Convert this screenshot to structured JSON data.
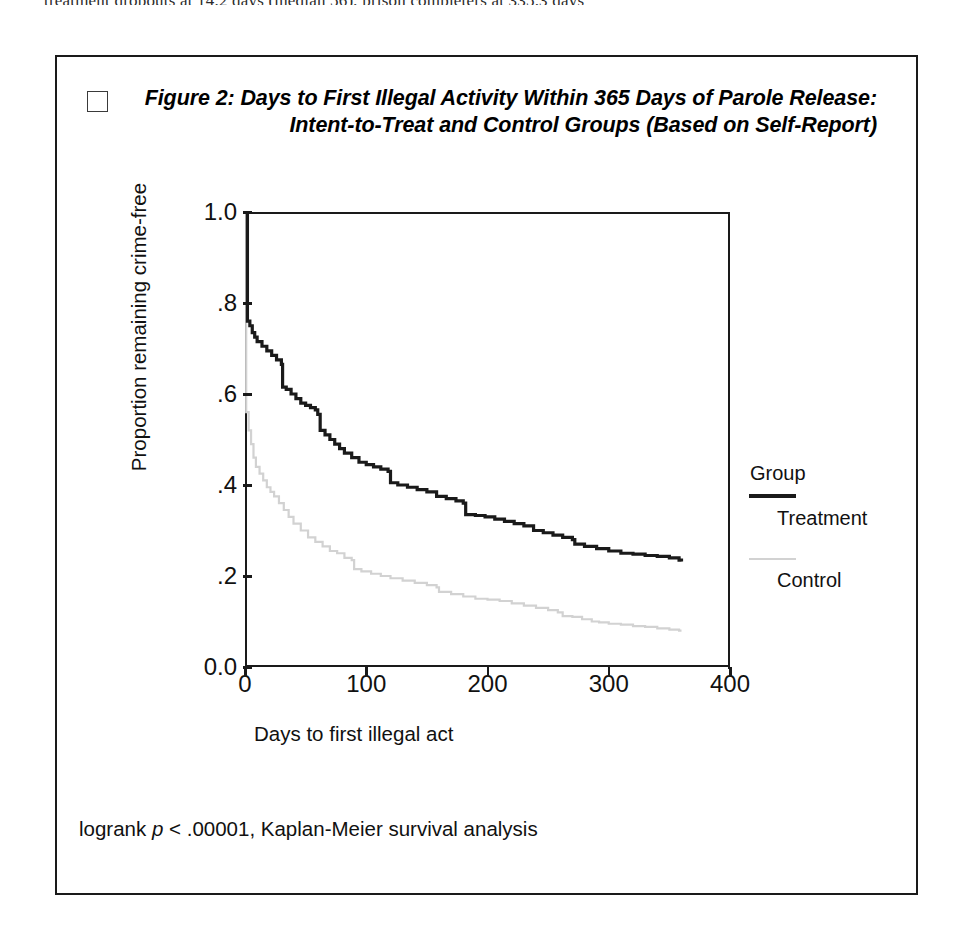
{
  "page": {
    "top_cut_text": "treatment dropouts at 14.2 days (median 56), prison completers at 335.3 days"
  },
  "figure": {
    "marker_icon": "empty-square-marker",
    "title": "Figure 2: Days to First Illegal Activity Within 365 Days of Parole Release: Intent-to-Treat and Control Groups (Based on Self-Report)",
    "footnote_prefix": "logrank ",
    "footnote_italic": "p",
    "footnote_rest": " < .00001, Kaplan-Meier survival analysis",
    "legend": {
      "title": "Group",
      "entries": [
        {
          "label": "Treatment",
          "color": "#1a1a1a"
        },
        {
          "label": "Control",
          "color": "#d2d2d2"
        }
      ]
    }
  },
  "chart_data": {
    "type": "line",
    "subtype": "kaplan-meier-survival",
    "title": "Figure 2: Days to First Illegal Activity Within 365 Days of Parole Release: Intent-to-Treat and Control Groups (Based on Self-Report)",
    "xlabel": "Days to first illegal act",
    "ylabel": "Proportion remaining crime-free",
    "xlim": [
      0,
      400
    ],
    "ylim": [
      0.0,
      1.0
    ],
    "xticks": [
      0,
      100,
      200,
      300,
      400
    ],
    "xtick_labels": [
      "0",
      "100",
      "200",
      "300",
      "400"
    ],
    "yticks": [
      0.0,
      0.2,
      0.4,
      0.6,
      0.8,
      1.0
    ],
    "ytick_labels": [
      "0.0",
      ".2",
      ".4",
      ".6",
      ".8",
      "1.0"
    ],
    "grid": false,
    "legend_position": "right",
    "annotation": "logrank p < .00001, Kaplan-Meier survival analysis",
    "series": [
      {
        "name": "Treatment",
        "color": "#1a1a1a",
        "style": "solid-step",
        "x": [
          0,
          2,
          4,
          6,
          8,
          10,
          14,
          18,
          22,
          26,
          30,
          31,
          34,
          38,
          42,
          46,
          50,
          54,
          58,
          60,
          62,
          66,
          70,
          74,
          78,
          82,
          88,
          94,
          100,
          106,
          112,
          118,
          120,
          126,
          134,
          142,
          150,
          158,
          166,
          174,
          180,
          182,
          190,
          198,
          206,
          214,
          222,
          230,
          238,
          246,
          254,
          262,
          270,
          272,
          280,
          290,
          300,
          310,
          320,
          330,
          340,
          350,
          358,
          360
        ],
        "y": [
          1.0,
          0.76,
          0.75,
          0.735,
          0.725,
          0.715,
          0.705,
          0.695,
          0.685,
          0.675,
          0.665,
          0.615,
          0.61,
          0.6,
          0.59,
          0.58,
          0.575,
          0.57,
          0.565,
          0.555,
          0.52,
          0.51,
          0.5,
          0.49,
          0.48,
          0.47,
          0.46,
          0.45,
          0.445,
          0.44,
          0.435,
          0.43,
          0.405,
          0.4,
          0.395,
          0.39,
          0.385,
          0.375,
          0.37,
          0.365,
          0.36,
          0.335,
          0.333,
          0.33,
          0.325,
          0.32,
          0.315,
          0.31,
          0.3,
          0.295,
          0.29,
          0.285,
          0.28,
          0.27,
          0.265,
          0.26,
          0.255,
          0.25,
          0.248,
          0.245,
          0.243,
          0.24,
          0.235,
          0.232
        ]
      },
      {
        "name": "Control",
        "color": "#d2d2d2",
        "style": "solid-step-light",
        "x": [
          0,
          1,
          3,
          5,
          7,
          9,
          12,
          15,
          18,
          21,
          24,
          28,
          32,
          36,
          40,
          46,
          52,
          58,
          64,
          70,
          76,
          82,
          88,
          90,
          96,
          104,
          112,
          120,
          130,
          140,
          150,
          158,
          160,
          170,
          180,
          190,
          200,
          210,
          220,
          230,
          240,
          250,
          258,
          262,
          270,
          278,
          286,
          292,
          300,
          310,
          320,
          330,
          340,
          350,
          358,
          360
        ],
        "y": [
          1.0,
          0.56,
          0.52,
          0.49,
          0.46,
          0.44,
          0.425,
          0.41,
          0.395,
          0.385,
          0.375,
          0.36,
          0.345,
          0.33,
          0.315,
          0.3,
          0.285,
          0.275,
          0.265,
          0.255,
          0.25,
          0.24,
          0.235,
          0.215,
          0.21,
          0.205,
          0.2,
          0.195,
          0.19,
          0.185,
          0.18,
          0.175,
          0.165,
          0.16,
          0.155,
          0.15,
          0.148,
          0.145,
          0.14,
          0.135,
          0.13,
          0.125,
          0.12,
          0.112,
          0.11,
          0.105,
          0.1,
          0.098,
          0.095,
          0.093,
          0.09,
          0.088,
          0.085,
          0.082,
          0.08,
          0.08
        ]
      }
    ]
  }
}
